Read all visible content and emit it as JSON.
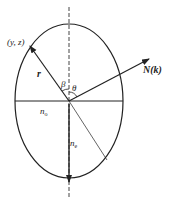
{
  "diagram": {
    "labels": {
      "point": "(y, z)",
      "r_vector": "r",
      "beta": "β",
      "theta": "θ",
      "normal": "N(k)",
      "n_o": "n",
      "n_o_sub": "o",
      "n_e": "n",
      "n_e_sub": "e"
    },
    "colors": {
      "stroke": "#222222",
      "dashed": "#444444"
    }
  }
}
